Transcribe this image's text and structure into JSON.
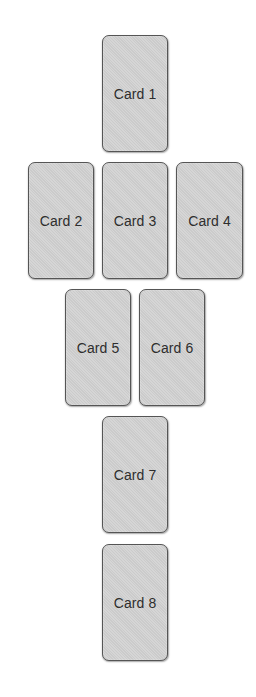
{
  "layout": {
    "title": "",
    "cards": [
      {
        "id": 1,
        "label": "Card 1",
        "x": 102,
        "y": 35,
        "w": 66,
        "h": 117
      },
      {
        "id": 2,
        "label": "Card 2",
        "x": 28,
        "y": 162,
        "w": 66,
        "h": 117
      },
      {
        "id": 3,
        "label": "Card 3",
        "x": 102,
        "y": 162,
        "w": 66,
        "h": 117
      },
      {
        "id": 4,
        "label": "Card 4",
        "x": 176,
        "y": 162,
        "w": 67,
        "h": 117
      },
      {
        "id": 5,
        "label": "Card 5",
        "x": 65,
        "y": 289,
        "w": 66,
        "h": 117
      },
      {
        "id": 6,
        "label": "Card 6",
        "x": 139,
        "y": 289,
        "w": 66,
        "h": 117
      },
      {
        "id": 7,
        "label": "Card 7",
        "x": 102,
        "y": 416,
        "w": 66,
        "h": 117
      },
      {
        "id": 8,
        "label": "Card 8",
        "x": 102,
        "y": 544,
        "w": 66,
        "h": 117
      }
    ]
  },
  "colors": {
    "card_fill": "#d3d3d3",
    "card_border": "#555555",
    "text": "#2e2e2e",
    "background": "#ffffff"
  }
}
